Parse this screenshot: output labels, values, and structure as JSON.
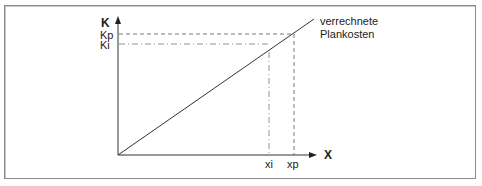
{
  "diagram": {
    "y_axis_label": "K",
    "x_axis_label": "X",
    "y_ticks": [
      "Kp",
      "Ki"
    ],
    "x_ticks": [
      "xi",
      "xp"
    ],
    "line_label_line1": "verrechnete",
    "line_label_line2": "Plankosten",
    "colors": {
      "line": "#333333",
      "frame": "#8a8a8a",
      "text": "#222222"
    }
  }
}
